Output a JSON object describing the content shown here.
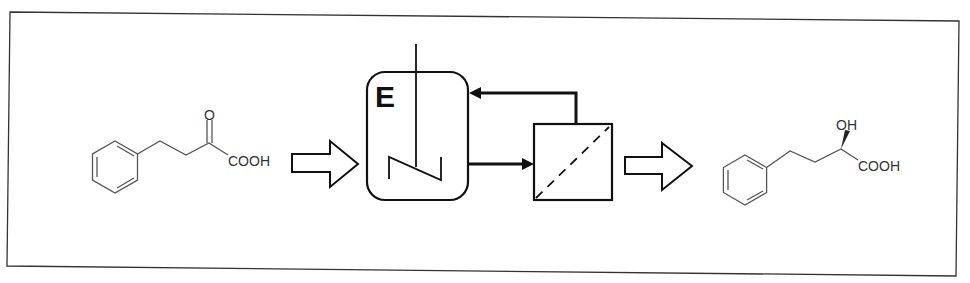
{
  "diagram": {
    "type": "enzymatic membrane reactor process scheme",
    "substrate": {
      "name": "2-oxo-4-phenylbutanoic acid",
      "labels": {
        "oxygen": "O",
        "acid": "COOH"
      }
    },
    "reactor": {
      "label": "E",
      "description": "stirred tank reactor containing enzyme"
    },
    "membrane_unit": {
      "description": "membrane filtration module (dashed diagonal membrane)"
    },
    "flows": [
      {
        "from": "substrate",
        "to": "reactor",
        "style": "block-arrow"
      },
      {
        "from": "reactor",
        "to": "membrane_unit",
        "style": "line-arrow"
      },
      {
        "from": "membrane_unit",
        "to": "reactor",
        "style": "recycle-line-arrow"
      },
      {
        "from": "membrane_unit",
        "to": "product",
        "style": "block-arrow"
      }
    ],
    "product": {
      "name": "(R)-2-hydroxy-4-phenylbutanoic acid",
      "labels": {
        "hydroxyl": "OH",
        "acid": "COOH"
      }
    },
    "colors": {
      "line": "#111111",
      "text": "#333333",
      "background": "#ffffff"
    }
  }
}
